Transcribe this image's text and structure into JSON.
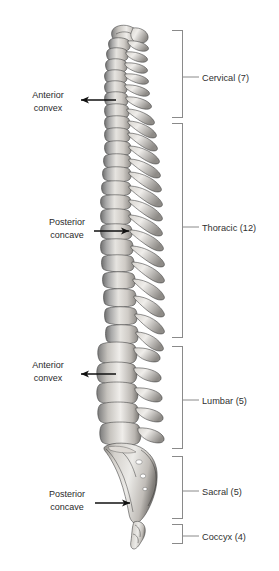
{
  "figure": {
    "background_color": "#ffffff",
    "line_color": "#8a8a8a",
    "arrow_color": "#111111",
    "text_color": "#2a2a2a"
  },
  "regions": [
    {
      "id": "cervical",
      "label": "Cervical (7)",
      "count": 7,
      "bracket_top": 30,
      "bracket_bottom": 117,
      "label_y": 77
    },
    {
      "id": "thoracic",
      "label": "Thoracic (12)",
      "count": 12,
      "bracket_top": 123,
      "bracket_bottom": 337,
      "label_y": 227
    },
    {
      "id": "lumbar",
      "label": "Lumbar (5)",
      "count": 5,
      "bracket_top": 346,
      "bracket_bottom": 448,
      "label_y": 400
    },
    {
      "id": "sacral",
      "label": "Sacral (5)",
      "count": 5,
      "bracket_top": 456,
      "bracket_bottom": 518,
      "label_y": 491
    },
    {
      "id": "coccyx",
      "label": "Coccyx (4)",
      "count": 4,
      "bracket_top": 524,
      "bracket_bottom": 543,
      "label_y": 536
    }
  ],
  "curvature_annotations": [
    {
      "id": "cervical-anterior-convex",
      "line1": "Anterior",
      "line2": "convex",
      "arrow_direction": "left",
      "text_anchor_x": 48,
      "line1_y": 95,
      "line2_y": 108,
      "arrow_from_x": 116,
      "arrow_to_x": 79,
      "arrow_y": 100
    },
    {
      "id": "thoracic-posterior-concave",
      "line1": "Posterior",
      "line2": "concave",
      "arrow_direction": "right",
      "text_anchor_x": 67,
      "line1_y": 222,
      "line2_y": 235,
      "arrow_from_x": 92,
      "arrow_to_x": 131,
      "arrow_y": 228
    },
    {
      "id": "lumbar-anterior-convex",
      "line1": "Anterior",
      "line2": "convex",
      "arrow_direction": "left",
      "text_anchor_x": 48,
      "line1_y": 365,
      "line2_y": 378,
      "arrow_from_x": 116,
      "arrow_to_x": 79,
      "arrow_y": 371
    },
    {
      "id": "sacral-posterior-concave",
      "line1": "Posterior",
      "line2": "concave",
      "arrow_direction": "right",
      "text_anchor_x": 67,
      "line1_y": 494,
      "line2_y": 507,
      "arrow_from_x": 93,
      "arrow_to_x": 132,
      "arrow_y": 501
    }
  ],
  "bracket_geometry": {
    "spine_x": 182,
    "cap_x": 172,
    "leader_from_x": 182,
    "leader_to_x": 198,
    "label_x": 201
  }
}
